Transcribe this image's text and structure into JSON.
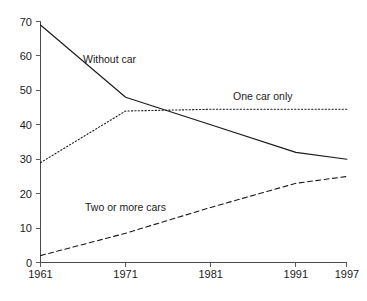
{
  "chart_data": {
    "type": "line",
    "title": "",
    "subtitle": "",
    "xlabel": "",
    "ylabel": "",
    "x": [
      1961,
      1971,
      1981,
      1991,
      1997
    ],
    "xtick_labels": [
      "1961",
      "1971",
      "1981",
      "1991",
      "1997"
    ],
    "ytick_labels": [
      "0",
      "10",
      "20",
      "30",
      "40",
      "50",
      "60",
      "70"
    ],
    "ytick_values": [
      0,
      10,
      20,
      30,
      40,
      50,
      60,
      70
    ],
    "xlim": [
      1961,
      1997
    ],
    "ylim": [
      0,
      70
    ],
    "grid": false,
    "legend_position": "inline-labels",
    "series": [
      {
        "name": "Without car",
        "style": "solid",
        "color": "#1a1a1a",
        "values": [
          69,
          48,
          40,
          32,
          30
        ],
        "label": "Without car"
      },
      {
        "name": "One car only",
        "style": "dotted",
        "color": "#1a1a1a",
        "values": [
          29,
          44,
          44.5,
          44.5,
          44.5
        ],
        "label": "One car only"
      },
      {
        "name": "Two or more cars",
        "style": "dashed",
        "color": "#1a1a1a",
        "values": [
          2,
          8.5,
          16,
          23,
          25
        ],
        "label": "Two or more cars"
      }
    ],
    "annotations": [
      {
        "text": "Without car",
        "x": 1964.5,
        "y": 60
      },
      {
        "text": "One car only",
        "x": 1985.5,
        "y": 48.5
      },
      {
        "text": "Two or more cars",
        "x": 1969.5,
        "y": 15.5
      }
    ]
  },
  "axis": {
    "y_ticks": [
      "70",
      "60",
      "50",
      "40",
      "30",
      "20",
      "10",
      "0"
    ],
    "x_ticks": [
      "1961",
      "1971",
      "1981",
      "1991",
      "1997"
    ]
  },
  "labels": {
    "without_car": "Without car",
    "one_car_only": "One car only",
    "two_or_more_cars": "Two or more cars"
  },
  "colors": {
    "line": "#1a1a1a",
    "axis": "#4a4a4a",
    "background": "#ffffff"
  }
}
